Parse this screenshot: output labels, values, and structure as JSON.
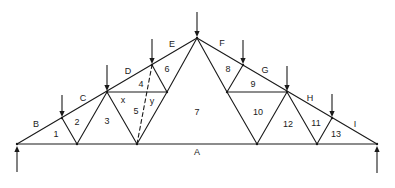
{
  "diagram": {
    "type": "roof-truss-bows-notation",
    "space_labels": [
      {
        "id": "A",
        "text": "A",
        "x": 197,
        "y": 152
      },
      {
        "id": "B",
        "text": "B",
        "x": 36,
        "y": 124
      },
      {
        "id": "C",
        "text": "C",
        "x": 83,
        "y": 98
      },
      {
        "id": "D",
        "text": "D",
        "x": 128,
        "y": 71
      },
      {
        "id": "E",
        "text": "E",
        "x": 172,
        "y": 44
      },
      {
        "id": "F",
        "text": "F",
        "x": 222,
        "y": 43
      },
      {
        "id": "G",
        "text": "G",
        "x": 265,
        "y": 70
      },
      {
        "id": "H",
        "text": "H",
        "x": 310,
        "y": 98
      },
      {
        "id": "I",
        "text": "I",
        "x": 355,
        "y": 124
      },
      {
        "id": "1",
        "text": "1",
        "x": 56,
        "y": 134
      },
      {
        "id": "2",
        "text": "2",
        "x": 77,
        "y": 122
      },
      {
        "id": "3",
        "text": "3",
        "x": 107,
        "y": 121
      },
      {
        "id": "x",
        "text": "x",
        "x": 123,
        "y": 100
      },
      {
        "id": "4",
        "text": "4",
        "x": 141,
        "y": 84
      },
      {
        "id": "5",
        "text": "5",
        "x": 136,
        "y": 111
      },
      {
        "id": "y",
        "text": "y",
        "x": 152,
        "y": 101
      },
      {
        "id": "6",
        "text": "6",
        "x": 167,
        "y": 69
      },
      {
        "id": "7",
        "text": "7",
        "x": 197,
        "y": 112
      },
      {
        "id": "8",
        "text": "8",
        "x": 228,
        "y": 69
      },
      {
        "id": "9",
        "text": "9",
        "x": 253,
        "y": 84
      },
      {
        "id": "10",
        "text": "10",
        "x": 258,
        "y": 112
      },
      {
        "id": "12",
        "text": "12",
        "x": 288,
        "y": 124
      },
      {
        "id": "11",
        "text": "11",
        "x": 316,
        "y": 123
      },
      {
        "id": "13",
        "text": "13",
        "x": 336,
        "y": 134
      }
    ],
    "nodes": {
      "L": [
        17,
        144
      ],
      "T1": [
        62,
        118
      ],
      "B1": [
        77,
        144
      ],
      "T2": [
        107,
        92
      ],
      "B2": [
        137,
        144
      ],
      "T3": [
        152,
        65
      ],
      "M1": [
        167,
        92
      ],
      "AP": [
        197,
        38
      ],
      "M2": [
        227,
        92
      ],
      "T4": [
        243,
        65
      ],
      "T5": [
        287,
        92
      ],
      "B3": [
        257,
        144
      ],
      "B4": [
        317,
        144
      ],
      "T6": [
        332,
        118
      ],
      "R": [
        377,
        144
      ]
    },
    "members": [
      [
        "L",
        "AP",
        "solid"
      ],
      [
        "AP",
        "R",
        "solid"
      ],
      [
        "L",
        "R",
        "solid"
      ],
      [
        "T1",
        "B1",
        "solid"
      ],
      [
        "B1",
        "T2",
        "solid"
      ],
      [
        "T2",
        "B2",
        "solid"
      ],
      [
        "T2",
        "M1",
        "solid"
      ],
      [
        "T3",
        "M1",
        "solid"
      ],
      [
        "B2",
        "M1",
        "solid"
      ],
      [
        "M1",
        "AP",
        "solid"
      ],
      [
        "B2",
        "T3",
        "dashed"
      ],
      [
        "AP",
        "M2",
        "solid"
      ],
      [
        "T4",
        "M2",
        "solid"
      ],
      [
        "M2",
        "T5",
        "solid"
      ],
      [
        "M2",
        "B3",
        "solid"
      ],
      [
        "B3",
        "T5",
        "solid"
      ],
      [
        "T5",
        "B4",
        "solid"
      ],
      [
        "B4",
        "T6",
        "solid"
      ]
    ],
    "loads": [
      {
        "node": "T1",
        "direction": "down",
        "x": 62,
        "y1": 95,
        "y2": 117
      },
      {
        "node": "T2",
        "direction": "down",
        "x": 107,
        "y1": 65,
        "y2": 91
      },
      {
        "node": "T3",
        "direction": "down",
        "x": 152,
        "y1": 39,
        "y2": 64
      },
      {
        "node": "AP",
        "direction": "down",
        "x": 197,
        "y1": 12,
        "y2": 37
      },
      {
        "node": "T4",
        "direction": "down",
        "x": 243,
        "y1": 40,
        "y2": 64
      },
      {
        "node": "T5",
        "direction": "down",
        "x": 287,
        "y1": 66,
        "y2": 91
      },
      {
        "node": "T6",
        "direction": "down",
        "x": 332,
        "y1": 94,
        "y2": 117
      }
    ],
    "reactions": [
      {
        "node": "L",
        "direction": "up",
        "x": 17,
        "y1": 172,
        "y2": 146
      },
      {
        "node": "R",
        "direction": "up",
        "x": 377,
        "y1": 173,
        "y2": 146
      }
    ]
  }
}
